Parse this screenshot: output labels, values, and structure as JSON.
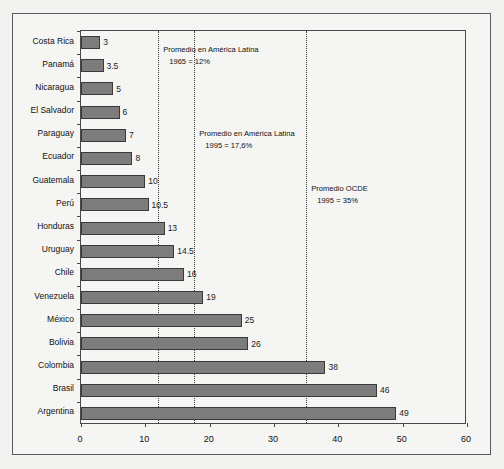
{
  "chart_data": {
    "type": "bar",
    "orientation": "horizontal",
    "title": "",
    "xlabel": "",
    "ylabel": "",
    "xlim": [
      0,
      60
    ],
    "grid": true,
    "legend": "none",
    "categories": [
      "Costa Rica",
      "Panamá",
      "Nicaragua",
      "El Salvador",
      "Paraguay",
      "Ecuador",
      "Guatemala",
      "Perú",
      "Honduras",
      "Uruguay",
      "Chile",
      "Venezuela",
      "México",
      "Bolivia",
      "Colombia",
      "Brasil",
      "Argentina"
    ],
    "values": [
      3,
      3.5,
      5,
      6,
      7,
      8,
      10,
      10.5,
      13,
      14.5,
      16,
      19,
      25,
      26,
      38,
      46,
      49
    ],
    "value_labels": [
      "3",
      "3.5",
      "5",
      "6",
      "7",
      "8",
      "10",
      "10.5",
      "13",
      "14.5",
      "16",
      "19",
      "25",
      "26",
      "38",
      "46",
      "49"
    ],
    "xticks": [
      0,
      10,
      20,
      30,
      40,
      50,
      60
    ],
    "xtick_labels": [
      "0",
      "10",
      "20",
      "30",
      "40",
      "50",
      "60"
    ],
    "reference_lines": [
      {
        "value": 12,
        "name": "promedio-america-latina-1965"
      },
      {
        "value": 17.6,
        "name": "promedio-america-latina-1995"
      },
      {
        "value": 35,
        "name": "promedio-ocde-1995"
      }
    ],
    "annotations": [
      {
        "line1": "Promedio en América Latina",
        "line2": "1965 = 12%",
        "x": 12
      },
      {
        "line1": "Promedio en América Latina",
        "line2": "1995 = 17,6%",
        "x": 17.6
      },
      {
        "line1": "Promedio OCDE",
        "line2": "1995 = 35%",
        "x": 35
      }
    ],
    "colors": {
      "bar_fill": "#7d7d7d",
      "bar_edge": "#3a3a3a",
      "axis": "#4a4a4a",
      "gridline": "#3b3b3b",
      "background": "#f3f3f1",
      "text": "#111111"
    }
  }
}
